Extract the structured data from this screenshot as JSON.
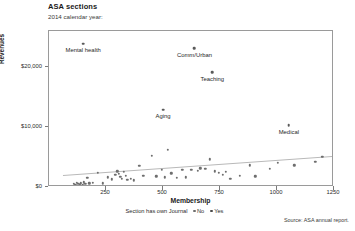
{
  "header": {
    "title": "ASA sections",
    "subtitle": "2014 calendar year:"
  },
  "footer": {
    "source": "Source: ASA annual report."
  },
  "legend": {
    "title": "Section has own Journal",
    "items": [
      {
        "label": "No",
        "color": "#6e6e6e"
      },
      {
        "label": "Yes",
        "color": "#4a4a4a"
      }
    ]
  },
  "chart_data": {
    "type": "scatter",
    "title": "ASA sections",
    "subtitle": "2014 calendar year:",
    "xlabel": "Membership",
    "ylabel": "Revenues",
    "xlim": [
      0,
      1250
    ],
    "ylim": [
      0,
      26000
    ],
    "grid": false,
    "legend_position": "bottom",
    "legend_title": "Section has own Journal",
    "xticks": [
      250,
      500,
      750,
      1000,
      1250
    ],
    "xticklabels": [
      "250",
      "500",
      "750",
      "1000",
      "1250"
    ],
    "yticks": [
      0,
      10000,
      20000
    ],
    "yticklabels": [
      "$0",
      "$10,000",
      "$20,000"
    ],
    "series": [
      {
        "name": "No",
        "color": "#6e6e6e",
        "points": [
          {
            "x": 150,
            "y": 23900,
            "label": "Mental health"
          },
          {
            "x": 638,
            "y": 23100,
            "label": "Comm/Urban"
          },
          {
            "x": 716,
            "y": 19100,
            "label": "Teaching"
          },
          {
            "x": 500,
            "y": 12900,
            "label": "Aging"
          },
          {
            "x": 1052,
            "y": 10300,
            "label": "Medical"
          },
          {
            "x": 108,
            "y": 500
          },
          {
            "x": 116,
            "y": 400
          },
          {
            "x": 122,
            "y": 700
          },
          {
            "x": 128,
            "y": 500
          },
          {
            "x": 134,
            "y": 300
          },
          {
            "x": 140,
            "y": 600
          },
          {
            "x": 147,
            "y": 400
          },
          {
            "x": 152,
            "y": 800
          },
          {
            "x": 160,
            "y": 500
          },
          {
            "x": 168,
            "y": 1500
          },
          {
            "x": 176,
            "y": 600
          },
          {
            "x": 192,
            "y": 700
          },
          {
            "x": 214,
            "y": 2400
          },
          {
            "x": 236,
            "y": 600
          },
          {
            "x": 258,
            "y": 1600
          },
          {
            "x": 276,
            "y": 1300
          },
          {
            "x": 290,
            "y": 2000
          },
          {
            "x": 300,
            "y": 2600
          },
          {
            "x": 306,
            "y": 2200
          },
          {
            "x": 312,
            "y": 1700
          },
          {
            "x": 320,
            "y": 1400
          },
          {
            "x": 328,
            "y": 2500
          },
          {
            "x": 336,
            "y": 1900
          },
          {
            "x": 344,
            "y": 1200
          },
          {
            "x": 358,
            "y": 1400
          },
          {
            "x": 372,
            "y": 1100
          },
          {
            "x": 396,
            "y": 3500
          },
          {
            "x": 414,
            "y": 1900
          },
          {
            "x": 450,
            "y": 5200
          },
          {
            "x": 470,
            "y": 1800
          },
          {
            "x": 496,
            "y": 2900
          },
          {
            "x": 508,
            "y": 1600
          },
          {
            "x": 522,
            "y": 6200
          },
          {
            "x": 536,
            "y": 2300
          },
          {
            "x": 560,
            "y": 1500
          },
          {
            "x": 584,
            "y": 2900
          },
          {
            "x": 600,
            "y": 1600
          },
          {
            "x": 624,
            "y": 2900
          },
          {
            "x": 652,
            "y": 2700
          },
          {
            "x": 664,
            "y": 3100
          },
          {
            "x": 686,
            "y": 3000
          },
          {
            "x": 706,
            "y": 4600
          },
          {
            "x": 726,
            "y": 2600
          },
          {
            "x": 746,
            "y": 2400
          },
          {
            "x": 762,
            "y": 2000
          },
          {
            "x": 776,
            "y": 2500
          },
          {
            "x": 796,
            "y": 1400
          },
          {
            "x": 836,
            "y": 1900
          },
          {
            "x": 880,
            "y": 3600
          },
          {
            "x": 904,
            "y": 1800
          },
          {
            "x": 968,
            "y": 3000
          },
          {
            "x": 1004,
            "y": 4000
          },
          {
            "x": 1076,
            "y": 3600
          },
          {
            "x": 1168,
            "y": 4200
          },
          {
            "x": 1198,
            "y": 5000
          }
        ]
      }
    ],
    "trendline": {
      "name": "fit",
      "color": "#b9b9b9",
      "x_start": 60,
      "y_start": 2050,
      "x_end": 1240,
      "y_end": 5200
    },
    "annotations": [
      {
        "text": "Mental health",
        "x": 150,
        "y": 23900
      },
      {
        "text": "Comm/Urban",
        "x": 638,
        "y": 23100
      },
      {
        "text": "Teaching",
        "x": 716,
        "y": 19100
      },
      {
        "text": "Aging",
        "x": 500,
        "y": 12900
      },
      {
        "text": "Medical",
        "x": 1052,
        "y": 10300
      }
    ]
  }
}
